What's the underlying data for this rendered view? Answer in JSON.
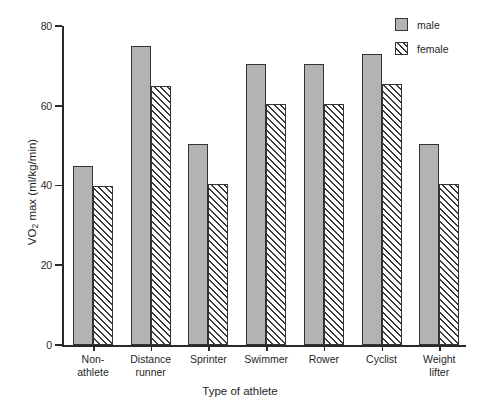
{
  "chart_data": {
    "type": "bar",
    "title": "",
    "xlabel": "Type of athlete",
    "ylabel": "VO2 max (ml/kg/min)",
    "ylabel_prefix": "VO",
    "ylabel_sub": "2",
    "ylabel_suffix": " max (ml/kg/min)",
    "categories": [
      "Non-\nathlete",
      "Distance\nrunner",
      "Sprinter",
      "Swimmer",
      "Rower",
      "Cyclist",
      "Weight\nlifter"
    ],
    "category_lines": [
      [
        "Non-",
        "athlete"
      ],
      [
        "Distance",
        "runner"
      ],
      [
        "Sprinter",
        ""
      ],
      [
        "Swimmer",
        ""
      ],
      [
        "Rower",
        ""
      ],
      [
        "Cyclist",
        ""
      ],
      [
        "Weight",
        "lifter"
      ]
    ],
    "series": [
      {
        "name": "male",
        "color": "#b3b3b3",
        "pattern": "solid-fill",
        "values": [
          45,
          75,
          50.5,
          70.5,
          70.5,
          73,
          50.5
        ]
      },
      {
        "name": "female",
        "color": "#ffffff",
        "pattern": "diagonal-hatch",
        "values": [
          40,
          65,
          40.5,
          60.5,
          60.5,
          65.5,
          40.5
        ]
      }
    ],
    "yticks": [
      0,
      20,
      40,
      60,
      80
    ],
    "ytick_labels": [
      "0",
      "20",
      "40",
      "60",
      "80"
    ],
    "ylim": [
      0,
      80
    ],
    "grid": false,
    "legend_position": "top-right",
    "legend_entries": [
      "male",
      "female"
    ],
    "axis_color": "#2a2a2a",
    "bar_border_color": "#333333",
    "background": "#ffffff"
  }
}
